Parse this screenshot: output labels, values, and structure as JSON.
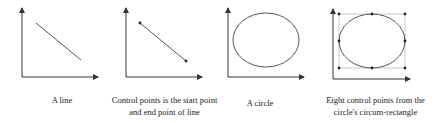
{
  "panels": [
    {
      "id": "line",
      "caption_lines": [
        "A line"
      ]
    },
    {
      "id": "line-control-points",
      "caption_lines": [
        "Control points is the start point",
        "and end point of line"
      ]
    },
    {
      "id": "circle",
      "caption_lines": [
        "A circle"
      ]
    },
    {
      "id": "circle-control-points",
      "caption_lines": [
        "Eight control points from the",
        "circle's  circum-rectangle"
      ]
    }
  ],
  "colors": {
    "axis": "#333333",
    "shape": "#555555",
    "control_point": "#222222",
    "bounding_rect": "#bbbbbb"
  }
}
